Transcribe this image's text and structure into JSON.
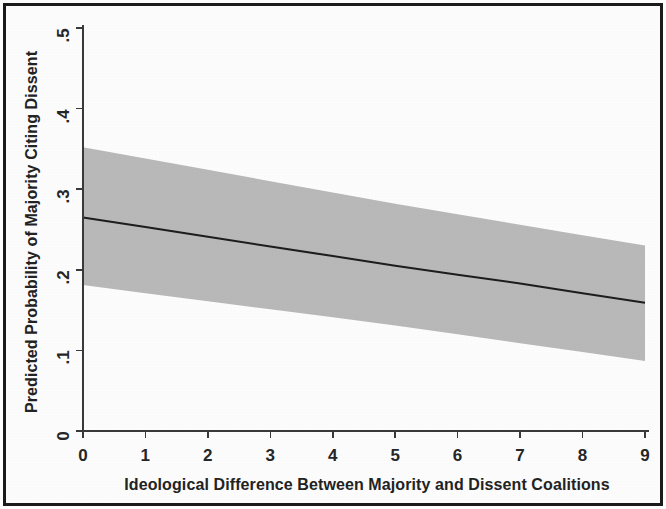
{
  "figure": {
    "frame_color": "#1b1b1b",
    "plot_background": "#fdfdfd",
    "band_color": "#b9b9b9",
    "line_color": "#1d1d1d",
    "axis_color": "#3a3a3a"
  },
  "chart_data": {
    "type": "line",
    "title": "",
    "subtitle": "",
    "xlabel": "Ideological Difference Between Majority and Dissent Coalitions",
    "ylabel": "Predicted Probability of Majority Citing Dissent",
    "xlim": [
      0,
      9
    ],
    "ylim": [
      0,
      0.5
    ],
    "xticks": [
      0,
      1,
      2,
      3,
      4,
      5,
      6,
      7,
      8,
      9
    ],
    "xtick_labels": [
      "0",
      "1",
      "2",
      "3",
      "4",
      "5",
      "6",
      "7",
      "8",
      "9"
    ],
    "yticks": [
      0,
      0.1,
      0.2,
      0.3,
      0.4,
      0.5
    ],
    "ytick_labels": [
      "0",
      ".1",
      ".2",
      ".3",
      ".4",
      ".5"
    ],
    "grid": false,
    "legend": null,
    "legend_position": "none",
    "annotations": [],
    "x": [
      0,
      1,
      2,
      3,
      4,
      5,
      6,
      7,
      8,
      9
    ],
    "series": [
      {
        "name": "Predicted probability",
        "kind": "line",
        "values": [
          0.265,
          0.253,
          0.241,
          0.229,
          0.217,
          0.205,
          0.194,
          0.183,
          0.171,
          0.159
        ]
      },
      {
        "name": "95% confidence interval upper bound",
        "kind": "band-upper",
        "values": [
          0.352,
          0.338,
          0.324,
          0.31,
          0.296,
          0.282,
          0.269,
          0.256,
          0.243,
          0.23
        ]
      },
      {
        "name": "95% confidence interval lower bound",
        "kind": "band-lower",
        "values": [
          0.181,
          0.171,
          0.161,
          0.151,
          0.141,
          0.131,
          0.12,
          0.109,
          0.098,
          0.087
        ]
      }
    ]
  }
}
